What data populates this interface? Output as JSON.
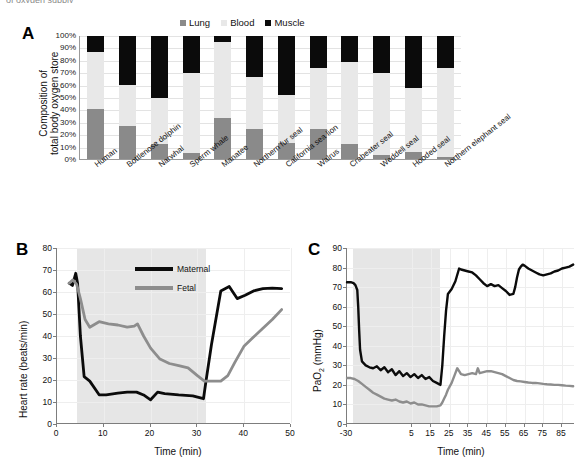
{
  "figure": {
    "cut_top_text": "of oxygen supply"
  },
  "panelA": {
    "letter": "A",
    "ylabel_line1": "Composition of",
    "ylabel_line2": "total body oxygen store",
    "legend": [
      {
        "label": "Lung",
        "color": "#8a8a8a"
      },
      {
        "label": "Blood",
        "color": "#e8e8e8"
      },
      {
        "label": "Muscle",
        "color": "#0b0b0b"
      }
    ],
    "yticks": [
      "100%",
      "90%",
      "80%",
      "70%",
      "60%",
      "50%",
      "40%",
      "30%",
      "20%",
      "10%",
      "0%"
    ]
  },
  "panelB": {
    "letter": "B",
    "ylabel": "Heart rate (beats/min)",
    "xlabel": "Time (min)",
    "yticks": [
      0,
      10,
      20,
      30,
      40,
      50,
      60,
      70,
      80
    ],
    "xticks": [
      0,
      10,
      20,
      30,
      40,
      50
    ],
    "legend": [
      {
        "label": "Maternal",
        "color": "#0b0b0b"
      },
      {
        "label": "Fetal",
        "color": "#8d8d8d"
      }
    ],
    "shade_start": 4.2,
    "shade_end": 31.8
  },
  "panelC": {
    "letter": "C",
    "ylabel": "PaO",
    "ylabel_sub": "2",
    "ylabel_unit": " (mmHg)",
    "xlabel": "Time (min)",
    "yticks": [
      0,
      10,
      20,
      30,
      40,
      50,
      60,
      70,
      80,
      90
    ],
    "xticks": [
      -30,
      5,
      15,
      25,
      35,
      45,
      55,
      65,
      75,
      85
    ],
    "shade_start": -27.0,
    "shade_end": 20.0
  },
  "chart_data": [
    {
      "type": "bar",
      "id": "panelA",
      "stacked": true,
      "title": "",
      "xlabel": "",
      "ylabel": "Composition of total body oxygen store",
      "ylim": [
        0,
        100
      ],
      "grid": true,
      "legend_position": "top",
      "categories": [
        "Human",
        "Bottlenose dolphin",
        "Narwhal",
        "Sperm whale",
        "Manatee",
        "Northern fur seal",
        "California sea lion",
        "Walrus",
        "Crabeater seal",
        "Weddell seal",
        "Hooded seal",
        "Northern elephant seal"
      ],
      "series": [
        {
          "name": "Lung",
          "color": "#8a8a8a",
          "values": [
            41,
            27,
            12,
            5,
            33,
            24,
            13,
            24,
            12,
            3,
            6,
            2
          ]
        },
        {
          "name": "Blood",
          "color": "#e8e8e8",
          "values": [
            46,
            33,
            38,
            65,
            62,
            43,
            39,
            50,
            67,
            67,
            52,
            72
          ]
        },
        {
          "name": "Muscle",
          "color": "#0b0b0b",
          "values": [
            13,
            40,
            50,
            30,
            5,
            33,
            48,
            26,
            21,
            30,
            42,
            26
          ]
        }
      ]
    },
    {
      "type": "line",
      "id": "panelB",
      "title": "",
      "xlabel": "Time (min)",
      "ylabel": "Heart rate (beats/min)",
      "xlim": [
        0,
        50
      ],
      "ylim": [
        0,
        80
      ],
      "grid": true,
      "legend_position": "inside-top",
      "shaded_region": {
        "x0": 4.2,
        "x1": 31.8,
        "color": "#e6e6e6"
      },
      "series": [
        {
          "name": "Maternal",
          "color": "#0b0b0b",
          "x": [
            2.6,
            3.3,
            4.0,
            4.4,
            5.0,
            5.8,
            7.0,
            9.0,
            10.5,
            13.0,
            15.0,
            17.0,
            18.5,
            20.0,
            21.5,
            23.0,
            26.0,
            29.0,
            31.3,
            31.8,
            33.0,
            35.0,
            36.8,
            38.5,
            40.2,
            42.0,
            44.0,
            46.0,
            48.0
          ],
          "y": [
            64.0,
            63.0,
            68.5,
            64.0,
            40.0,
            21.5,
            19.5,
            13.3,
            13.2,
            14.0,
            14.5,
            14.5,
            13.2,
            11.0,
            14.5,
            13.8,
            13.2,
            12.8,
            11.5,
            19.0,
            36.0,
            60.5,
            62.5,
            57.0,
            58.5,
            60.5,
            61.5,
            61.8,
            61.5
          ]
        },
        {
          "name": "Fetal",
          "color": "#8d8d8d",
          "x": [
            2.6,
            3.4,
            4.2,
            5.0,
            6.0,
            7.0,
            9.0,
            11.0,
            13.0,
            15.0,
            16.5,
            17.2,
            18.5,
            20.0,
            22.0,
            24.0,
            26.0,
            28.0,
            30.0,
            31.5,
            33.0,
            35.0,
            36.5,
            38.0,
            40.0,
            42.0,
            44.0,
            46.0,
            48.0
          ],
          "y": [
            64.0,
            65.5,
            63.5,
            57.0,
            47.5,
            44.0,
            46.5,
            45.5,
            45.0,
            44.0,
            44.5,
            45.5,
            40.0,
            34.5,
            29.5,
            27.5,
            26.5,
            25.5,
            22.0,
            19.5,
            19.5,
            19.5,
            22.0,
            28.0,
            35.5,
            39.5,
            43.5,
            47.5,
            52.0
          ]
        }
      ]
    },
    {
      "type": "line",
      "id": "panelC",
      "title": "",
      "xlabel": "Time (min)",
      "ylabel": "PaO2 (mmHg)",
      "xlim": [
        -30,
        92
      ],
      "ylim": [
        0,
        90
      ],
      "grid": true,
      "legend_position": "none",
      "shaded_region": {
        "x0": -27.0,
        "x1": 20.0,
        "color": "#e6e6e6"
      },
      "series": [
        {
          "name": "Arterial (black)",
          "color": "#0b0b0b",
          "x": [
            -30,
            -28,
            -26.5,
            -25.5,
            -24.5,
            -24,
            -23.5,
            -23,
            -22,
            -20,
            -18,
            -16,
            -14,
            -12,
            -10,
            -8,
            -6,
            -4,
            -2,
            0,
            2,
            4,
            6,
            8,
            10,
            12,
            14,
            16,
            18,
            19,
            19.5,
            20,
            21,
            22,
            23,
            24,
            26,
            28,
            30,
            31,
            33,
            35,
            37,
            39,
            41,
            43,
            45,
            47,
            49,
            51,
            53,
            55,
            57,
            59,
            60,
            61,
            62,
            63,
            64,
            65,
            67,
            69,
            71,
            73,
            75,
            77,
            79,
            81,
            83,
            85,
            87,
            89,
            91
          ],
          "y": [
            72.5,
            72.5,
            72.0,
            71.0,
            68.5,
            60.0,
            48.0,
            38.0,
            32.0,
            30.0,
            29.0,
            28.5,
            29.5,
            27.5,
            29.0,
            26.5,
            28.0,
            25.0,
            27.0,
            24.5,
            26.0,
            24.0,
            25.5,
            23.5,
            25.0,
            23.0,
            24.0,
            22.0,
            21.0,
            20.5,
            20.2,
            20.0,
            30.0,
            45.0,
            58.0,
            66.5,
            69.0,
            73.0,
            79.5,
            79.0,
            78.5,
            78.0,
            77.5,
            76.0,
            74.0,
            72.0,
            70.5,
            71.5,
            70.5,
            71.0,
            69.5,
            68.0,
            66.0,
            66.5,
            70.0,
            75.0,
            79.0,
            80.5,
            81.5,
            81.0,
            79.5,
            78.5,
            77.5,
            76.5,
            76.0,
            76.5,
            77.0,
            78.0,
            78.5,
            79.5,
            80.0,
            80.5,
            81.5
          ]
        },
        {
          "name": "Venous (gray)",
          "color": "#8d8d8d",
          "x": [
            -30,
            -28,
            -26,
            -24,
            -22,
            -20,
            -18,
            -16,
            -14,
            -12,
            -10,
            -8,
            -6,
            -4,
            -2,
            0,
            2,
            4,
            6,
            8,
            10,
            12,
            14,
            16,
            18,
            20,
            21,
            22,
            23,
            24,
            26,
            28,
            29,
            30,
            31,
            33,
            35,
            37,
            39,
            40,
            41,
            43,
            45,
            47,
            49,
            51,
            53,
            55,
            57,
            59,
            61,
            63,
            65,
            67,
            69,
            71,
            73,
            75,
            77,
            79,
            81,
            83,
            85,
            87,
            89,
            91
          ],
          "y": [
            23.5,
            23.5,
            23.0,
            22.0,
            20.5,
            19.0,
            17.5,
            16.0,
            15.0,
            14.0,
            13.0,
            12.5,
            12.0,
            12.5,
            11.5,
            11.0,
            11.5,
            10.5,
            11.0,
            10.0,
            10.0,
            9.5,
            9.0,
            9.0,
            9.0,
            9.5,
            11.0,
            13.0,
            15.0,
            17.5,
            21.0,
            26.0,
            28.5,
            27.0,
            25.5,
            25.0,
            25.5,
            26.0,
            25.5,
            28.5,
            26.0,
            26.5,
            27.0,
            27.0,
            26.5,
            26.0,
            25.5,
            24.5,
            23.5,
            22.5,
            22.0,
            21.8,
            21.5,
            21.2,
            21.0,
            21.0,
            20.8,
            20.5,
            20.3,
            20.2,
            20.0,
            20.0,
            19.8,
            19.6,
            19.5,
            19.3
          ]
        }
      ]
    }
  ]
}
